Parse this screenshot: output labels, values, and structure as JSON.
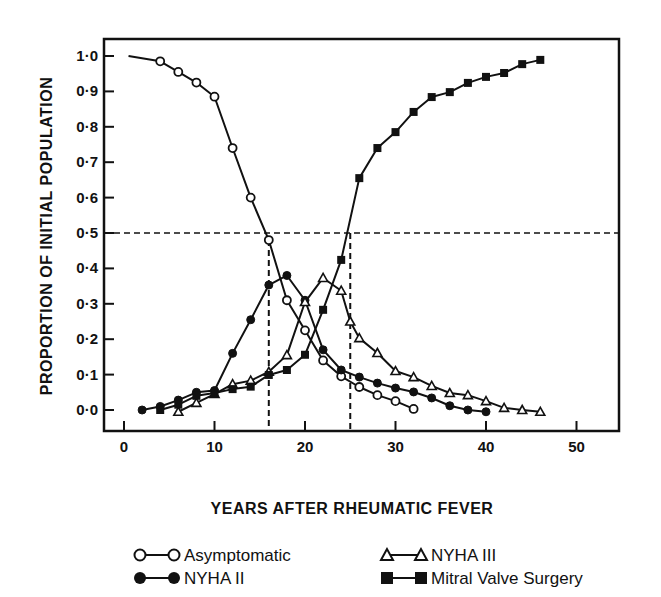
{
  "chart_data": {
    "type": "line",
    "title": "",
    "xlabel": "YEARS AFTER RHEUMATIC FEVER",
    "ylabel": "PROPORTION OF INITIAL POPULATION",
    "xlim": [
      -2,
      55
    ],
    "ylim": [
      -0.02,
      1.03
    ],
    "xticks": [
      0,
      10,
      20,
      30,
      40,
      50
    ],
    "xtick_labels": [
      "0",
      "10",
      "20",
      "30",
      "40",
      "50"
    ],
    "yticks": [
      0.0,
      0.1,
      0.2,
      0.3,
      0.4,
      0.5,
      0.6,
      0.7,
      0.8,
      0.9,
      1.0
    ],
    "ytick_labels": [
      "0·0",
      "0·1",
      "0·2",
      "0·3",
      "0·4",
      "0·5",
      "0·6",
      "0·7",
      "0·8",
      "0·9",
      "1·0"
    ],
    "grid": false,
    "legend_position": "bottom",
    "reference_lines": [
      {
        "type": "horizontal",
        "y": 0.5,
        "style": "dashed"
      },
      {
        "type": "vertical",
        "x": 16,
        "y_to": 0.48,
        "style": "dashed"
      },
      {
        "type": "vertical",
        "x": 25,
        "y_to": 0.5,
        "style": "dashed"
      }
    ],
    "series": [
      {
        "name": "Asymptomatic",
        "marker": "open-circle",
        "line_start": {
          "x": 0.5,
          "y": 1.0
        },
        "x": [
          4,
          6,
          8,
          10,
          12,
          14,
          16,
          18,
          20,
          22,
          24,
          26,
          28,
          30,
          32
        ],
        "values": [
          0.985,
          0.955,
          0.925,
          0.885,
          0.74,
          0.6,
          0.48,
          0.31,
          0.225,
          0.14,
          0.095,
          0.065,
          0.042,
          0.025,
          0.003
        ]
      },
      {
        "name": "NYHA II",
        "marker": "filled-circle",
        "x": [
          2,
          4,
          6,
          8,
          10,
          12,
          14,
          16,
          18,
          20,
          22,
          24,
          26,
          28,
          30,
          32,
          34,
          36,
          38,
          40
        ],
        "values": [
          0.0,
          0.01,
          0.028,
          0.05,
          0.055,
          0.16,
          0.255,
          0.353,
          0.38,
          0.31,
          0.17,
          0.113,
          0.093,
          0.076,
          0.062,
          0.051,
          0.034,
          0.012,
          0.0,
          -0.005
        ]
      },
      {
        "name": "NYHA III",
        "marker": "open-triangle",
        "x": [
          6,
          8,
          10,
          12,
          14,
          16,
          18,
          20,
          22,
          24,
          25,
          26,
          28,
          30,
          32,
          34,
          36,
          38,
          40,
          42,
          44,
          46
        ],
        "values": [
          -0.005,
          0.02,
          0.045,
          0.073,
          0.083,
          0.108,
          0.155,
          0.305,
          0.373,
          0.337,
          0.25,
          0.203,
          0.161,
          0.11,
          0.093,
          0.068,
          0.048,
          0.042,
          0.025,
          0.006,
          0.0,
          -0.005
        ]
      },
      {
        "name": "Mitral Valve Surgery",
        "marker": "filled-square",
        "x": [
          4,
          6,
          8,
          10,
          12,
          14,
          16,
          18,
          20,
          22,
          24,
          26,
          28,
          30,
          32,
          34,
          36,
          38,
          40,
          42,
          44,
          46
        ],
        "values": [
          0.0,
          0.015,
          0.04,
          0.048,
          0.059,
          0.066,
          0.099,
          0.113,
          0.156,
          0.283,
          0.424,
          0.655,
          0.74,
          0.785,
          0.842,
          0.884,
          0.898,
          0.924,
          0.941,
          0.952,
          0.977,
          0.989
        ]
      }
    ]
  },
  "legend": {
    "items": [
      {
        "label": "Asymptomatic",
        "marker": "open-circle"
      },
      {
        "label": "NYHA II",
        "marker": "filled-circle"
      },
      {
        "label": "NYHA III",
        "marker": "open-triangle"
      },
      {
        "label": "Mitral Valve Surgery",
        "marker": "filled-square"
      }
    ]
  },
  "colors": {
    "ink": "#111111",
    "background": "#ffffff"
  }
}
